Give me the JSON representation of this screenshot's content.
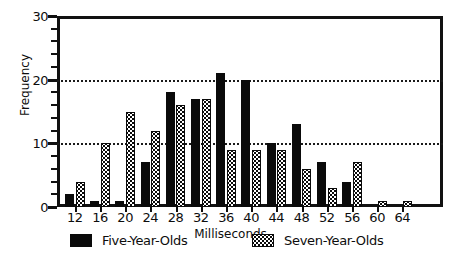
{
  "chart_data": {
    "type": "bar",
    "title": "",
    "xlabel": "Milliseconds",
    "ylabel": "Frequency",
    "categories": [
      "12",
      "16",
      "20",
      "24",
      "28",
      "32",
      "36",
      "40",
      "44",
      "48",
      "52",
      "56",
      "60",
      "64"
    ],
    "series": [
      {
        "name": "Five-Year-Olds",
        "fill": "solid-black",
        "color": "#0a0a0a",
        "values": [
          2,
          1,
          1,
          7,
          18,
          17,
          21,
          20,
          10,
          13,
          7,
          4,
          0,
          0
        ]
      },
      {
        "name": "Seven-Year-Olds",
        "fill": "stippled",
        "color": "#0a0a0a",
        "values": [
          4,
          10,
          15,
          12,
          16,
          17,
          9,
          9,
          9,
          6,
          3,
          7,
          1,
          1
        ]
      }
    ],
    "ylim": [
      0,
      30
    ],
    "ytick_labels": [
      "0",
      "10",
      "20",
      "30"
    ],
    "ytick_values": [
      0,
      10,
      20,
      30
    ],
    "yminor_step": 2,
    "gridlines": [
      10,
      20
    ],
    "grid": "horizontal-dotted",
    "legend_position": "bottom"
  },
  "legend": {
    "items": [
      {
        "label": "Five-Year-Olds",
        "swatch": "solid-swatch"
      },
      {
        "label": "Seven-Year-Olds",
        "swatch": "stippled-swatch"
      }
    ]
  },
  "axis": {
    "y_title": "Frequency",
    "x_title": "Milliseconds"
  }
}
